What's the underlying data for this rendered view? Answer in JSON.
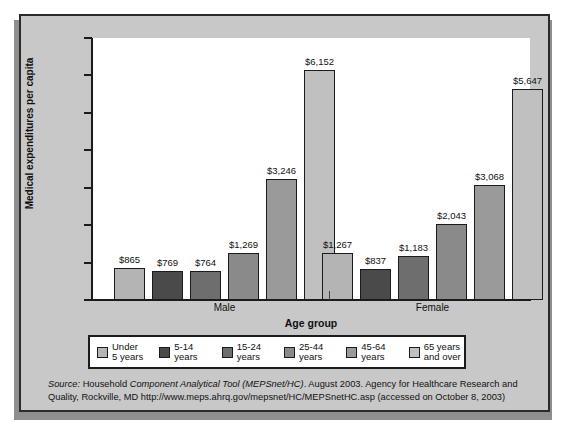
{
  "chart_data": {
    "type": "bar",
    "title": "",
    "xlabel": "Age group",
    "ylabel": "Medical expenditures per capita",
    "ylim": [
      0,
      7000
    ],
    "ytick_labels": [
      "$7,000",
      "$6,000",
      "$5,000",
      "$4,000",
      "$3,000",
      "$2,000",
      "$1,000",
      "$0"
    ],
    "ytick_values": [
      7000,
      6000,
      5000,
      4000,
      3000,
      2000,
      1000,
      0
    ],
    "grid": false,
    "legend_position": "bottom",
    "categories": [
      "Male",
      "Female"
    ],
    "series": [
      {
        "name": "Under 5 years",
        "color": "#b4b4b4",
        "values": [
          865,
          1267
        ],
        "labels": [
          "$865",
          "$1,267"
        ]
      },
      {
        "name": "5-14 years",
        "color": "#4a4a4a",
        "values": [
          769,
          837
        ],
        "labels": [
          "$769",
          "$837"
        ]
      },
      {
        "name": "15-24 years",
        "color": "#6e6e6e",
        "values": [
          764,
          1183
        ],
        "labels": [
          "$764",
          "$1,183"
        ]
      },
      {
        "name": "25-44 years",
        "color": "#8a8a8a",
        "values": [
          1269,
          2043
        ],
        "labels": [
          "$1,269",
          "$2,043"
        ]
      },
      {
        "name": "45-64 years",
        "color": "#9a9a9a",
        "values": [
          3246,
          3068
        ],
        "labels": [
          "$3,246",
          "$3,068"
        ]
      },
      {
        "name": "65 years and over",
        "color": "#c0c0c0",
        "values": [
          6152,
          5647
        ],
        "labels": [
          "$6,152",
          "$5,647"
        ]
      }
    ]
  },
  "legend": {
    "items": [
      {
        "line1": "Under",
        "line2": "5 years",
        "color": "#b4b4b4"
      },
      {
        "line1": "5-14",
        "line2": "years",
        "color": "#4a4a4a"
      },
      {
        "line1": "15-24",
        "line2": "years",
        "color": "#6e6e6e"
      },
      {
        "line1": "25-44",
        "line2": "years",
        "color": "#8a8a8a"
      },
      {
        "line1": "45-64",
        "line2": "years",
        "color": "#9a9a9a"
      },
      {
        "line1": "65 years",
        "line2": "and over",
        "color": "#c0c0c0"
      }
    ]
  },
  "source": {
    "label": "Source:",
    "text_part1": " Household ",
    "italic_part": "Component Analytical Tool (MEPSnet/HC)",
    "text_part2": ". August 2003. Agency for Healthcare Research and Quality, Rockville, MD http://www.meps.ahrq.gov/mepsnet/HC/MEPSnetHC.asp (accessed on October 8, 2003)"
  },
  "colors": {
    "panel_background": "#c8c8c8",
    "plot_background": "#ffffff",
    "axis": "#1b1b1b",
    "shadow": "#8e8e8e"
  }
}
